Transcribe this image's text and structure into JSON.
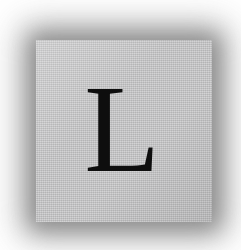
{
  "image": {
    "kind": "letter-tile-photo",
    "background_color": "#ffffff",
    "canvas": {
      "width": 241,
      "height": 250
    }
  },
  "tile": {
    "label": "letter tile",
    "fill_color": "#c3c3c4",
    "shadow_color": "#6f6f6f",
    "x": 36,
    "y": 40,
    "width": 176,
    "height": 182
  },
  "glyph": {
    "character": "L",
    "color": "#0e0e0e",
    "style": "serif capital",
    "font_size_px": 124
  }
}
